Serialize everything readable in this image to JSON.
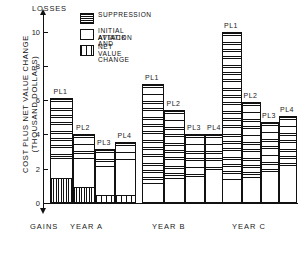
{
  "chart_data": {
    "type": "bar",
    "title": "",
    "ylabel_line1": "COST PLUS NET VALUE CHANGE",
    "ylabel_line2": "(THOUSAND DOLLARS)",
    "top_axis_note": "LOSSES",
    "bottom_axis_note": "GAINS",
    "ylim": [
      0,
      10.8
    ],
    "yticks": [
      0,
      2,
      4,
      6,
      8,
      10
    ],
    "ytick_labels": [
      "0",
      "2",
      "4",
      "6",
      "8",
      "10"
    ],
    "grid": false,
    "stacked": true,
    "legend_position": "top-center",
    "series": [
      {
        "name": "SUPPRESSION",
        "pattern": "horizontal-lines"
      },
      {
        "name": "INITIAL ATTACK AND AVIATION",
        "pattern": "blank"
      },
      {
        "name": "NET VALUE CHANGE",
        "pattern": "vertical-lines"
      }
    ],
    "groups": [
      {
        "label": "YEAR A",
        "bars": [
          {
            "label": "PL1",
            "total": 6.15,
            "net_value_change": 1.5,
            "initial_attack_and_aviation": 1.2,
            "suppression": 3.45
          },
          {
            "label": "PL2",
            "total": 4.05,
            "net_value_change": 1.0,
            "initial_attack_and_aviation": 1.7,
            "suppression": 1.35
          },
          {
            "label": "PL3",
            "total": 3.15,
            "net_value_change": 0.55,
            "initial_attack_and_aviation": 1.65,
            "suppression": 0.95
          },
          {
            "label": "PL4",
            "total": 3.55,
            "net_value_change": 0.55,
            "initial_attack_and_aviation": 2.05,
            "suppression": 0.95
          }
        ]
      },
      {
        "label": "YEAR B",
        "bars": [
          {
            "label": "PL1",
            "total": 6.95,
            "net_value_change": 0.1,
            "initial_attack_and_aviation": 1.1,
            "suppression": 5.75
          },
          {
            "label": "PL2",
            "total": 5.45,
            "net_value_change": 0.1,
            "initial_attack_and_aviation": 1.4,
            "suppression": 3.95
          },
          {
            "label": "PL3",
            "total": 4.0,
            "net_value_change": 0.1,
            "initial_attack_and_aviation": 1.55,
            "suppression": 2.35
          },
          {
            "label": "PL4",
            "total": 4.0,
            "net_value_change": 0.1,
            "initial_attack_and_aviation": 1.95,
            "suppression": 1.95
          }
        ]
      },
      {
        "label": "YEAR C",
        "bars": [
          {
            "label": "PL1",
            "total": 10.0,
            "net_value_change": 0.1,
            "initial_attack_and_aviation": 1.35,
            "suppression": 8.55
          },
          {
            "label": "PL2",
            "total": 5.9,
            "net_value_change": 0.1,
            "initial_attack_and_aviation": 1.5,
            "suppression": 4.3
          },
          {
            "label": "PL3",
            "total": 4.75,
            "net_value_change": 0.1,
            "initial_attack_and_aviation": 1.8,
            "suppression": 2.85
          },
          {
            "label": "PL4",
            "total": 5.05,
            "net_value_change": 0.1,
            "initial_attack_and_aviation": 2.15,
            "suppression": 2.8
          }
        ]
      }
    ]
  },
  "axis": {
    "losses": "LOSSES",
    "gains": "GAINS",
    "y_title_1": "COST PLUS NET VALUE CHANGE",
    "y_title_2": "(THOUSAND DOLLARS)",
    "ticks": [
      "10",
      "8",
      "6",
      "4",
      "2",
      "0"
    ]
  },
  "legend": {
    "items": [
      {
        "label": "SUPPRESSION",
        "label2": ""
      },
      {
        "label": "INITIAL ATTACK AND",
        "label2": "AVIATION"
      },
      {
        "label": "NET VALUE CHANGE",
        "label2": ""
      }
    ]
  },
  "groups": [
    {
      "label": "YEAR A"
    },
    {
      "label": "YEAR B"
    },
    {
      "label": "YEAR C"
    }
  ]
}
